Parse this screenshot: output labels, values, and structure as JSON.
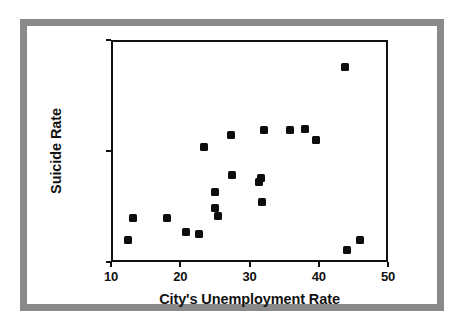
{
  "figure": {
    "frame_color": "#8a8a8a",
    "background": "#ffffff",
    "marker_color": "#0d0d0d"
  },
  "chart_data": {
    "type": "scatter",
    "title": "",
    "xlabel": "City's Unemployment Rate",
    "ylabel": "Suicide Rate",
    "xlim": [
      10,
      50
    ],
    "ylim": [
      0,
      20
    ],
    "xticks": [
      10,
      20,
      30,
      40,
      50
    ],
    "yticks": [
      0,
      10,
      20
    ],
    "xtick_labels": [
      "10",
      "20",
      "30",
      "40",
      "50"
    ],
    "ytick_labels": [
      "0",
      "10",
      "20"
    ],
    "grid": false,
    "legend": null,
    "marker": "square",
    "points": [
      {
        "x": 12.5,
        "y": 2.0
      },
      {
        "x": 13.2,
        "y": 4.0
      },
      {
        "x": 18.1,
        "y": 4.0
      },
      {
        "x": 20.8,
        "y": 2.7
      },
      {
        "x": 22.7,
        "y": 2.5
      },
      {
        "x": 23.4,
        "y": 10.4
      },
      {
        "x": 25.0,
        "y": 6.3
      },
      {
        "x": 25.0,
        "y": 4.9
      },
      {
        "x": 25.5,
        "y": 4.1
      },
      {
        "x": 27.3,
        "y": 11.4
      },
      {
        "x": 27.5,
        "y": 7.8
      },
      {
        "x": 31.4,
        "y": 7.2
      },
      {
        "x": 31.7,
        "y": 7.6
      },
      {
        "x": 31.8,
        "y": 5.4
      },
      {
        "x": 32.1,
        "y": 11.9
      },
      {
        "x": 35.8,
        "y": 11.9
      },
      {
        "x": 38.0,
        "y": 12.0
      },
      {
        "x": 39.6,
        "y": 11.0
      },
      {
        "x": 43.8,
        "y": 17.6
      },
      {
        "x": 44.1,
        "y": 1.1
      },
      {
        "x": 45.9,
        "y": 2.0
      }
    ]
  }
}
